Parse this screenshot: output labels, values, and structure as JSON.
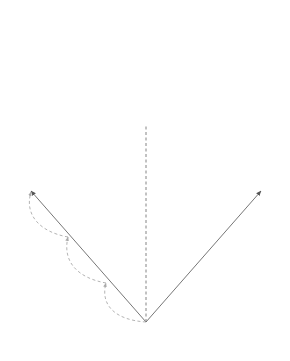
{
  "figure": {
    "type": "koch-curve-self-similarity",
    "center_label": "O",
    "center_caption": "닮음의 중심",
    "colors": {
      "curve": "#555555",
      "arrow": "#666666",
      "dashed_arc": "#aaaaaa",
      "axis_dashed": "#666666",
      "text": "#333333"
    },
    "parts": {
      "top": "four sub-curves of the Koch curve shown separated",
      "bottom": "large Koch curve and scaled copy sharing center of similarity O"
    }
  }
}
